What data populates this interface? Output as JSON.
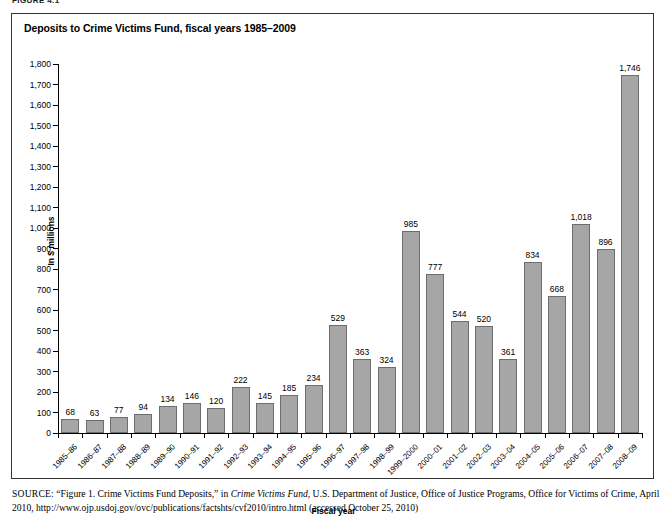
{
  "figure_label": "FIGURE 4.1",
  "chart_title": "Deposits to Crime Victims Fund, fiscal years 1985–2009",
  "source": {
    "kicker": "SOURCE:",
    "part1": " “Figure 1. Crime Victims Fund Deposits,” in ",
    "italic1": "Crime Victims Fund",
    "part2": ", U.S. Department of Justice, Office of Justice Programs, Office for Victims of Crime, April 2010, http://www.ojp.usdoj.gov/ovc/publications/factshts/cvf2010/intro.html (accessed October 25, 2010)"
  },
  "colors": {
    "bar_fill": "#a6a6a6",
    "bar_stroke": "#6d6d6d",
    "axis": "#000000",
    "frame": "#333333",
    "text": "#000000"
  },
  "chart_data": {
    "type": "bar",
    "title": "Deposits to Crime Victims Fund, fiscal years 1985–2009",
    "xlabel": "Fiscal year",
    "ylabel": "In $ millions",
    "ylim": [
      0,
      1800
    ],
    "ytick_step": 100,
    "grid": false,
    "legend": null,
    "ytick_labels": [
      "1,800",
      "1,700",
      "1,600",
      "1,500",
      "1,400",
      "1,300",
      "1,200",
      "1,100",
      "1,000",
      "900",
      "800",
      "700",
      "600",
      "500",
      "400",
      "300",
      "200",
      "100",
      "0"
    ],
    "categories": [
      "1985–86",
      "1986–87",
      "1987–88",
      "1988–89",
      "1989–90",
      "1990–91",
      "1991–92",
      "1992–93",
      "1993–94",
      "1994–95",
      "1995–96",
      "1996–97",
      "1997–98",
      "1998–99",
      "1999–2000",
      "2000–01",
      "2001–02",
      "2002–03",
      "2003–04",
      "2004–05",
      "2005–06",
      "2006–07",
      "2007–08",
      "2008–09"
    ],
    "values": [
      68,
      63,
      77,
      94,
      134,
      146,
      120,
      222,
      145,
      185,
      234,
      529,
      363,
      324,
      985,
      777,
      544,
      520,
      361,
      834,
      668,
      1018,
      896,
      1746
    ],
    "value_labels": [
      "68",
      "63",
      "77",
      "94",
      "134",
      "146",
      "120",
      "222",
      "145",
      "185",
      "234",
      "529",
      "363",
      "324",
      "985",
      "777",
      "544",
      "520",
      "361",
      "834",
      "668",
      "1,018",
      "896",
      "1,746"
    ]
  }
}
